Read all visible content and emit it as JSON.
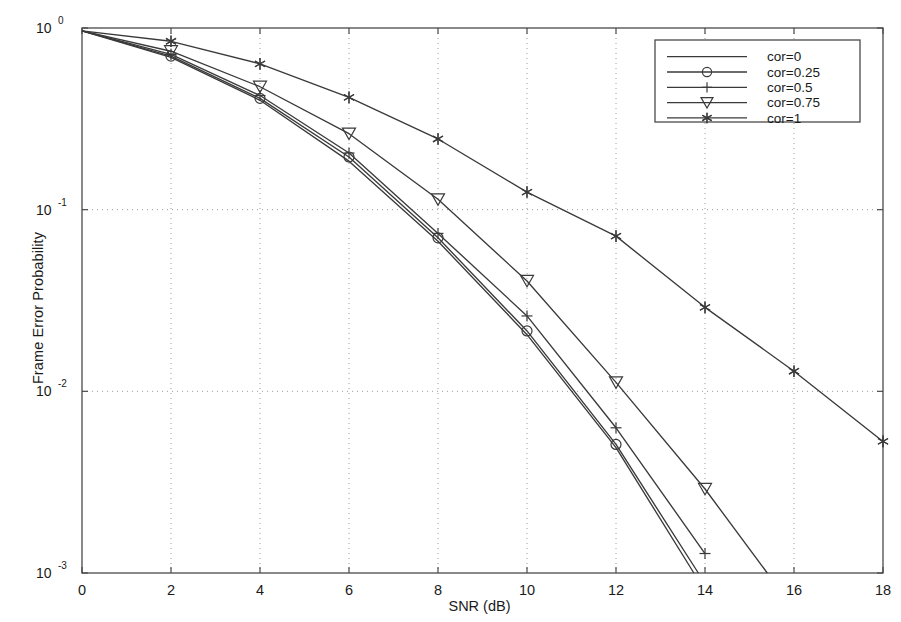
{
  "chart_data": {
    "type": "line",
    "title": "",
    "xlabel": "SNR (dB)",
    "ylabel": "Frame Error Probability",
    "xlim": [
      0,
      18
    ],
    "ylim": [
      0.001,
      1
    ],
    "yscale": "log",
    "xticks": [
      "0",
      "2",
      "4",
      "6",
      "8",
      "10",
      "12",
      "14",
      "16",
      "18"
    ],
    "xtick_values": [
      0,
      2,
      4,
      6,
      8,
      10,
      12,
      14,
      16,
      18
    ],
    "yticks": [
      "10^0",
      "10^-1",
      "10^-2",
      "10^-3"
    ],
    "ytick_values": [
      1,
      0.1,
      0.01,
      0.001
    ],
    "grid": "dotted",
    "legend_position": "top-right",
    "series": [
      {
        "name": "cor=0",
        "marker": "none",
        "x": [
          0,
          2,
          4,
          6,
          8,
          10,
          12,
          13.75
        ],
        "y": [
          0.965,
          0.69,
          0.4,
          0.185,
          0.067,
          0.0205,
          0.0049,
          0.001
        ]
      },
      {
        "name": "cor=0.25",
        "marker": "circle",
        "x": [
          0,
          2,
          4,
          6,
          8,
          10,
          12,
          13.85
        ],
        "y": [
          0.965,
          0.7,
          0.41,
          0.195,
          0.07,
          0.0215,
          0.0051,
          0.001
        ]
      },
      {
        "name": "cor=0.5",
        "marker": "plus",
        "x": [
          0,
          2,
          4,
          6,
          8,
          10,
          12,
          14
        ],
        "y": [
          0.965,
          0.715,
          0.425,
          0.205,
          0.074,
          0.026,
          0.0063,
          0.00128
        ]
      },
      {
        "name": "cor=0.75",
        "marker": "triangle-down",
        "x": [
          0,
          2,
          4,
          6,
          8,
          10,
          12,
          14,
          15.4
        ],
        "y": [
          0.965,
          0.745,
          0.475,
          0.262,
          0.114,
          0.0405,
          0.0112,
          0.0029,
          0.001
        ]
      },
      {
        "name": "cor=1",
        "marker": "star",
        "x": [
          0,
          2,
          4,
          6,
          8,
          10,
          12,
          14,
          16,
          18
        ],
        "y": [
          0.965,
          0.845,
          0.635,
          0.415,
          0.245,
          0.125,
          0.0715,
          0.029,
          0.0129,
          0.0053
        ]
      }
    ],
    "colors": {
      "line": "#3a3a3a",
      "axis": "#4a4a4a",
      "grid": "#9a9a9a",
      "text": "#1a1a1a",
      "background": "#ffffff"
    }
  },
  "legend": {
    "entries": [
      {
        "label": "cor=0"
      },
      {
        "label": "cor=0.25"
      },
      {
        "label": "cor=0.5"
      },
      {
        "label": "cor=0.75"
      },
      {
        "label": "cor=1"
      }
    ]
  }
}
